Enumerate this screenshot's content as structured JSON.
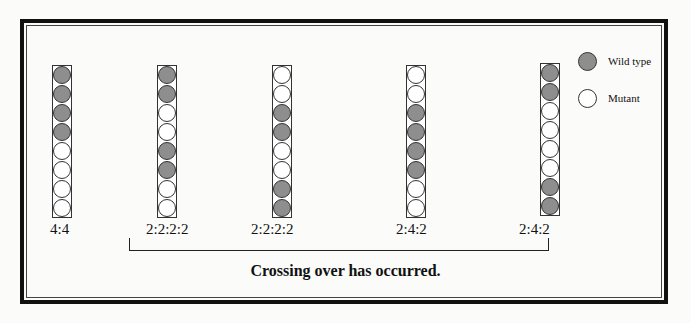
{
  "diagram": {
    "caption": "Crossing over has occurred.",
    "legend": [
      {
        "label": "Wild type",
        "color": "#8e8e8e"
      },
      {
        "label": "Mutant",
        "color": "#ffffff"
      }
    ],
    "asci": [
      {
        "ratio": "4:4",
        "spores": [
          "W",
          "W",
          "W",
          "W",
          "M",
          "M",
          "M",
          "M"
        ]
      },
      {
        "ratio": "2:2:2:2",
        "spores": [
          "W",
          "W",
          "M",
          "M",
          "W",
          "W",
          "M",
          "M"
        ]
      },
      {
        "ratio": "2:2:2:2",
        "spores": [
          "M",
          "M",
          "W",
          "W",
          "M",
          "M",
          "W",
          "W"
        ]
      },
      {
        "ratio": "2:4:2",
        "spores": [
          "M",
          "M",
          "W",
          "W",
          "W",
          "W",
          "M",
          "M"
        ]
      },
      {
        "ratio": "2:4:2",
        "spores": [
          "W",
          "W",
          "M",
          "M",
          "M",
          "M",
          "W",
          "W"
        ]
      }
    ]
  }
}
